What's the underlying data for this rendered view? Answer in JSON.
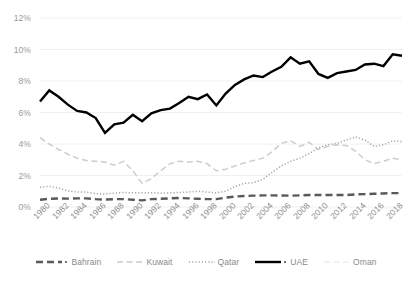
{
  "chart_data": {
    "type": "line",
    "title": "",
    "subtitle": "",
    "xlabel": "",
    "ylabel": "",
    "ylim": [
      0,
      12
    ],
    "yticks": [
      "0%",
      "2%",
      "4%",
      "6%",
      "8%",
      "10%",
      "12%"
    ],
    "ytick_values": [
      0,
      2,
      4,
      6,
      8,
      10,
      12
    ],
    "grid": true,
    "grid_axis": "y",
    "legend_position": "bottom",
    "x": [
      1980,
      1981,
      1982,
      1983,
      1984,
      1985,
      1986,
      1987,
      1988,
      1989,
      1990,
      1991,
      1992,
      1993,
      1994,
      1995,
      1996,
      1997,
      1998,
      1999,
      2000,
      2001,
      2002,
      2003,
      2004,
      2005,
      2006,
      2007,
      2008,
      2009,
      2010,
      2011,
      2012,
      2013,
      2014,
      2015,
      2016,
      2017,
      2018,
      2019
    ],
    "xtick_labels": [
      "1980",
      "1982",
      "1984",
      "1986",
      "1988",
      "1990",
      "1992",
      "1994",
      "1996",
      "1998",
      "2000",
      "2002",
      "2004",
      "2006",
      "2008",
      "2010",
      "2012",
      "2014",
      "2016",
      "2018"
    ],
    "series": [
      {
        "name": "Bahrain",
        "color": "#595959",
        "style": "dashed-thick",
        "values": [
          0.46,
          0.52,
          0.54,
          0.53,
          0.55,
          0.55,
          0.5,
          0.47,
          0.5,
          0.5,
          0.46,
          0.42,
          0.5,
          0.52,
          0.55,
          0.57,
          0.55,
          0.52,
          0.5,
          0.5,
          0.6,
          0.66,
          0.7,
          0.72,
          0.74,
          0.74,
          0.73,
          0.72,
          0.74,
          0.76,
          0.76,
          0.76,
          0.76,
          0.76,
          0.8,
          0.82,
          0.84,
          0.86,
          0.88,
          0.88
        ]
      },
      {
        "name": "Kuwait",
        "color": "#cdcdcd",
        "style": "dashed-light",
        "values": [
          4.4,
          4.0,
          3.65,
          3.35,
          3.1,
          2.95,
          2.9,
          2.85,
          2.65,
          2.9,
          2.3,
          1.5,
          1.8,
          2.3,
          2.75,
          2.9,
          2.85,
          2.9,
          2.75,
          2.3,
          2.4,
          2.6,
          2.8,
          2.95,
          3.1,
          3.5,
          4.05,
          4.2,
          3.85,
          4.1,
          3.65,
          3.85,
          3.95,
          3.9,
          3.55,
          3.0,
          2.75,
          2.9,
          3.1,
          3.0
        ]
      },
      {
        "name": "Qatar",
        "color": "#a6a6a6",
        "style": "dotted",
        "values": [
          1.25,
          1.32,
          1.2,
          1.02,
          0.95,
          0.95,
          0.85,
          0.82,
          0.88,
          0.92,
          0.9,
          0.9,
          0.9,
          0.88,
          0.9,
          0.92,
          0.95,
          1.0,
          0.95,
          0.9,
          1.0,
          1.3,
          1.5,
          1.55,
          1.75,
          2.2,
          2.6,
          2.9,
          3.1,
          3.4,
          3.75,
          3.95,
          4.05,
          4.25,
          4.45,
          4.25,
          3.85,
          3.95,
          4.2,
          4.15
        ]
      },
      {
        "name": "UAE",
        "color": "#000000",
        "style": "solid-thick",
        "values": [
          6.7,
          7.4,
          7.0,
          6.5,
          6.1,
          6.0,
          5.65,
          4.7,
          5.25,
          5.35,
          5.85,
          5.45,
          5.95,
          6.15,
          6.25,
          6.6,
          7.0,
          6.85,
          7.15,
          6.45,
          7.2,
          7.75,
          8.1,
          8.35,
          8.25,
          8.6,
          8.9,
          9.5,
          9.1,
          9.25,
          8.45,
          8.2,
          8.5,
          8.6,
          8.7,
          9.05,
          9.1,
          8.95,
          9.7,
          9.6
        ]
      },
      {
        "name": "Oman",
        "color": "#ededed",
        "style": "dashed-faint",
        "values": [
          null,
          null,
          null,
          null,
          null,
          null,
          null,
          null,
          null,
          null,
          null,
          null,
          null,
          null,
          null,
          null,
          null,
          null,
          null,
          null,
          null,
          null,
          null,
          null,
          null,
          null,
          null,
          null,
          null,
          null,
          null,
          null,
          null,
          null,
          null,
          null,
          null,
          null,
          null,
          null
        ]
      }
    ]
  },
  "legend": {
    "items": [
      {
        "label": "Bahrain",
        "marker": "bahrain-swatch"
      },
      {
        "label": "Kuwait",
        "marker": "kuwait-swatch"
      },
      {
        "label": "Qatar",
        "marker": "qatar-swatch"
      },
      {
        "label": "UAE",
        "marker": "uae-swatch"
      },
      {
        "label": "Oman",
        "marker": "oman-swatch"
      }
    ]
  },
  "axes": {
    "y_labels": [
      "12%",
      "10%",
      "8%",
      "6%",
      "4%",
      "2%",
      "0%"
    ],
    "x_labels": [
      "1980",
      "1982",
      "1984",
      "1986",
      "1988",
      "1990",
      "1992",
      "1994",
      "1996",
      "1998",
      "2000",
      "2002",
      "2004",
      "2006",
      "2008",
      "2010",
      "2012",
      "2014",
      "2016",
      "2018"
    ]
  }
}
